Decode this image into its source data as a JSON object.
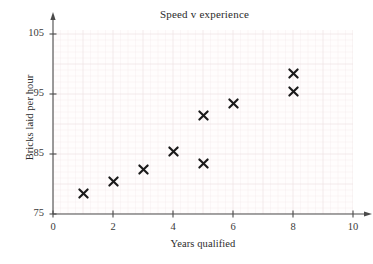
{
  "figure": {
    "title": "Speed v experience",
    "cropped_header_fragment": "",
    "marker_symbol": "×",
    "marker_color": "#1b1b1b",
    "grid_color": "#f0e4e6",
    "axis_color": "#4a4a4a",
    "background_color": "#ffffff"
  },
  "axes": {
    "x": {
      "label": "Years qualified",
      "ticks": [
        "0",
        "2",
        "4",
        "6",
        "8",
        "10"
      ],
      "tick_values": [
        0,
        2,
        4,
        6,
        8,
        10
      ],
      "min": 0,
      "max": 10,
      "has_arrow": true
    },
    "y": {
      "label": "Bricks laid per hour",
      "ticks": [
        "75",
        "85",
        "95",
        "105"
      ],
      "tick_values": [
        75,
        85,
        95,
        105
      ],
      "min": 75,
      "max": 106,
      "has_arrow": true
    }
  },
  "chart_data": {
    "type": "scatter",
    "title": "Speed v experience",
    "xlabel": "Years qualified",
    "ylabel": "Bricks laid per hour",
    "xlim": [
      0,
      10
    ],
    "ylim": [
      75,
      106
    ],
    "xticks": [
      0,
      2,
      4,
      6,
      8,
      10
    ],
    "yticks": [
      75,
      85,
      95,
      105
    ],
    "grid": true,
    "legend": null,
    "marker": "x",
    "series": [
      {
        "name": "Bricklayers",
        "points": [
          {
            "x": 1,
            "y": 79
          },
          {
            "x": 2,
            "y": 81
          },
          {
            "x": 3,
            "y": 83
          },
          {
            "x": 4,
            "y": 86
          },
          {
            "x": 5,
            "y": 84
          },
          {
            "x": 5,
            "y": 92
          },
          {
            "x": 6,
            "y": 94
          },
          {
            "x": 8,
            "y": 96
          },
          {
            "x": 8,
            "y": 99
          }
        ]
      }
    ]
  }
}
